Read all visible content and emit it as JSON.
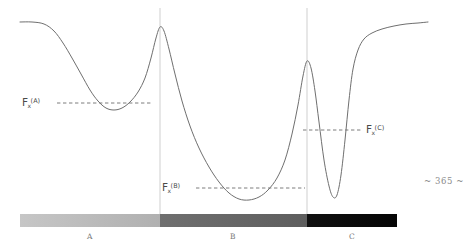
{
  "page": {
    "width": 473,
    "height": 247,
    "background": "#ffffff",
    "folio": "~ 365 ~"
  },
  "figure": {
    "curve_color": "#6f6f6f",
    "divider_color": "#cfcfcf",
    "dashed_color": "#5a5a5a",
    "label_color": "#4a4a4a"
  },
  "labels": {
    "basin_a": {
      "base": "F",
      "sub": "x",
      "sup": "(A)"
    },
    "basin_b": {
      "base": "F",
      "sub": "x",
      "sup": "(B)"
    },
    "basin_c": {
      "base": "F",
      "sub": "x",
      "sup": "(C)"
    }
  },
  "colorbar": {
    "segments": [
      {
        "label": "A",
        "color_start": "#c6c6c6",
        "color_end": "#b0b0b0"
      },
      {
        "label": "B",
        "color_start": "#6f6f6f",
        "color_end": "#5e5e5e"
      },
      {
        "label": "C",
        "color_start": "#101010",
        "color_end": "#050505"
      }
    ]
  },
  "chart_data": {
    "type": "line",
    "title": "",
    "xlabel": "",
    "ylabel": "",
    "grid": false,
    "legend": "none",
    "xlim": [
      0,
      473
    ],
    "ylim": [
      0,
      247
    ],
    "series": [
      {
        "name": "free-energy-profile",
        "description": "Smooth free energy curve with three basins A, B and C separated by two barriers",
        "points": [
          [
            20,
            22
          ],
          [
            32,
            22
          ],
          [
            44,
            24
          ],
          [
            54,
            31
          ],
          [
            63,
            43
          ],
          [
            72,
            58
          ],
          [
            81,
            74
          ],
          [
            90,
            90
          ],
          [
            98,
            101
          ],
          [
            106,
            108
          ],
          [
            114,
            110
          ],
          [
            122,
            108
          ],
          [
            130,
            102
          ],
          [
            138,
            92
          ],
          [
            145,
            78
          ],
          [
            151,
            58
          ],
          [
            156,
            38
          ],
          [
            160,
            27
          ],
          [
            164,
            31
          ],
          [
            169,
            49
          ],
          [
            175,
            74
          ],
          [
            182,
            101
          ],
          [
            190,
            126
          ],
          [
            199,
            148
          ],
          [
            209,
            167
          ],
          [
            219,
            182
          ],
          [
            229,
            193
          ],
          [
            239,
            199
          ],
          [
            249,
            200
          ],
          [
            259,
            197
          ],
          [
            268,
            190
          ],
          [
            277,
            178
          ],
          [
            285,
            160
          ],
          [
            292,
            134
          ],
          [
            298,
            105
          ],
          [
            303,
            76
          ],
          [
            307,
            61
          ],
          [
            311,
            68
          ],
          [
            315,
            91
          ],
          [
            319,
            122
          ],
          [
            324,
            160
          ],
          [
            329,
            186
          ],
          [
            333,
            197
          ],
          [
            337,
            195
          ],
          [
            341,
            175
          ],
          [
            345,
            140
          ],
          [
            349,
            100
          ],
          [
            353,
            69
          ],
          [
            358,
            50
          ],
          [
            364,
            39
          ],
          [
            372,
            33
          ],
          [
            382,
            29
          ],
          [
            394,
            26
          ],
          [
            406,
            24
          ],
          [
            418,
            23
          ],
          [
            428,
            22
          ]
        ]
      }
    ],
    "annotations": [
      {
        "name": "basin-a-level",
        "type": "dashed-hline",
        "y": 103,
        "x_start": 57,
        "x_end": 152,
        "label": "F_x^(A)",
        "label_x": 22,
        "label_y": 97
      },
      {
        "name": "basin-b-level",
        "type": "dashed-hline",
        "y": 188,
        "x_start": 196,
        "x_end": 305,
        "label": "F_x^(B)",
        "label_x": 162,
        "label_y": 182
      },
      {
        "name": "basin-c-level",
        "type": "dashed-hline",
        "y": 130,
        "x_start": 303,
        "x_end": 362,
        "label": "F_x^(C)",
        "label_x": 366,
        "label_y": 124
      },
      {
        "name": "barrier-1-divider",
        "type": "vline",
        "x": 160,
        "y_start": 8,
        "y_end": 215
      },
      {
        "name": "barrier-2-divider",
        "type": "vline",
        "x": 307,
        "y_start": 8,
        "y_end": 215
      }
    ],
    "colorbar": {
      "x_start": 20,
      "x_end": 397,
      "y_top": 214,
      "y_bottom": 227,
      "breaks": [
        160,
        307
      ],
      "tick_labels": [
        "A",
        "B",
        "C"
      ],
      "tick_positions": [
        90,
        233,
        352
      ]
    }
  }
}
